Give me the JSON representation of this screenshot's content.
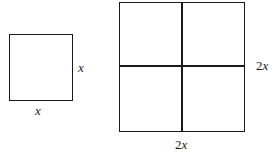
{
  "diagram": {
    "small_square": {
      "side_label_right": "x",
      "side_label_bottom": "x"
    },
    "large_square": {
      "grid": "2x2",
      "side_label_right": "2x",
      "side_label_bottom": "2x"
    },
    "colors": {
      "stroke": "#1a1a1a",
      "background": "#ffffff"
    }
  }
}
